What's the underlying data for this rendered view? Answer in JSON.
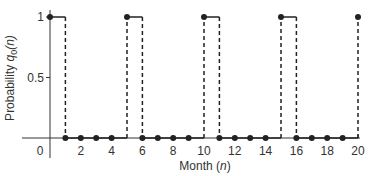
{
  "chart_data": {
    "type": "line",
    "subtype": "stem/step",
    "title": "",
    "xlabel": "Month (n)",
    "ylabel": "Probability q0(n)",
    "xlim": [
      0,
      20
    ],
    "ylim": [
      0,
      1
    ],
    "x_ticks": [
      "0",
      "2",
      "4",
      "6",
      "8",
      "10",
      "12",
      "14",
      "16",
      "18",
      "20"
    ],
    "y_ticks": [
      "0.5",
      "1"
    ],
    "grid": false,
    "x": [
      0,
      1,
      2,
      3,
      4,
      5,
      6,
      7,
      8,
      9,
      10,
      11,
      12,
      13,
      14,
      15,
      16,
      17,
      18,
      19,
      20
    ],
    "values": [
      1,
      0,
      0,
      0,
      0,
      1,
      0,
      0,
      0,
      0,
      1,
      0,
      0,
      0,
      0,
      1,
      0,
      0,
      0,
      0,
      1
    ],
    "style": {
      "line_color": "#222222",
      "dashed_verticals": true
    }
  },
  "axes": {
    "xlabel_main": "Month (",
    "xlabel_var": "n",
    "xlabel_end": ")",
    "ylabel_main": "Probability ",
    "ylabel_var": "q",
    "ylabel_sub": "0",
    "ylabel_arg": "(n)"
  }
}
